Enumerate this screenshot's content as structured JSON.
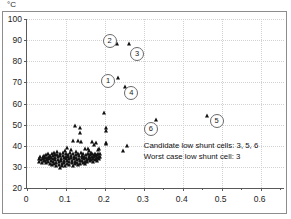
{
  "chart_data": {
    "type": "scatter",
    "title": "",
    "xlabel": "",
    "ylabel": "",
    "unit_label": "°C",
    "xlim": [
      0,
      0.66
    ],
    "ylim": [
      20,
      100
    ],
    "grid": true,
    "legend_position": "none",
    "xticks": [
      0,
      0.1,
      0.2,
      0.3,
      0.4,
      0.5,
      0.6
    ],
    "xtick_labels": [
      "0",
      "0.1",
      "0.2",
      "0.3",
      "0.4",
      "0.5",
      "0.6"
    ],
    "xminor_ticks": [
      0.05,
      0.15,
      0.25,
      0.35,
      0.45,
      0.55,
      0.65
    ],
    "yticks": [
      20,
      30,
      40,
      50,
      60,
      70,
      80,
      90,
      100
    ],
    "ytick_labels": [
      "20",
      "30",
      "40",
      "50",
      "60",
      "70",
      "80",
      "90",
      "100"
    ],
    "marker": "triangle",
    "marker_color": "#111111",
    "points": [
      [
        0.232,
        88.0
      ],
      [
        0.262,
        88.0
      ],
      [
        0.234,
        72.0
      ],
      [
        0.252,
        68.0
      ],
      [
        0.199,
        55.3
      ],
      [
        0.331,
        52.2
      ],
      [
        0.463,
        54.3
      ],
      [
        0.203,
        48.5
      ],
      [
        0.203,
        47.0
      ],
      [
        0.124,
        49.2
      ],
      [
        0.137,
        48.3
      ],
      [
        0.137,
        46.2
      ],
      [
        0.202,
        41.2
      ],
      [
        0.202,
        40.6
      ],
      [
        0.257,
        39.8
      ],
      [
        0.247,
        37.6
      ],
      [
        0.118,
        42.2
      ],
      [
        0.132,
        42.3
      ],
      [
        0.139,
        41.8
      ],
      [
        0.167,
        41.7
      ],
      [
        0.176,
        41.5
      ],
      [
        0.172,
        40.2
      ],
      [
        0.182,
        38.2
      ],
      [
        0.186,
        38.3
      ],
      [
        0.113,
        38.0
      ],
      [
        0.127,
        37.2
      ],
      [
        0.104,
        38.7
      ],
      [
        0.098,
        37.4
      ],
      [
        0.148,
        38.4
      ],
      [
        0.156,
        38.5
      ],
      [
        0.16,
        37.6
      ],
      [
        0.165,
        36.8
      ],
      [
        0.03,
        33.6
      ],
      [
        0.032,
        32.4
      ],
      [
        0.034,
        34.5
      ],
      [
        0.036,
        33.1
      ],
      [
        0.038,
        32.0
      ],
      [
        0.04,
        34.8
      ],
      [
        0.041,
        33.8
      ],
      [
        0.043,
        32.6
      ],
      [
        0.044,
        35.2
      ],
      [
        0.046,
        34.0
      ],
      [
        0.047,
        33.0
      ],
      [
        0.048,
        31.8
      ],
      [
        0.05,
        35.6
      ],
      [
        0.051,
        34.4
      ],
      [
        0.052,
        33.3
      ],
      [
        0.054,
        32.2
      ],
      [
        0.055,
        36.0
      ],
      [
        0.056,
        34.7
      ],
      [
        0.057,
        33.6
      ],
      [
        0.058,
        31.4
      ],
      [
        0.06,
        35.1
      ],
      [
        0.061,
        34.1
      ],
      [
        0.062,
        32.9
      ],
      [
        0.063,
        30.9
      ],
      [
        0.064,
        36.3
      ],
      [
        0.066,
        35.0
      ],
      [
        0.067,
        33.9
      ],
      [
        0.068,
        32.5
      ],
      [
        0.069,
        31.2
      ],
      [
        0.07,
        36.6
      ],
      [
        0.071,
        35.4
      ],
      [
        0.072,
        34.2
      ],
      [
        0.073,
        33.1
      ],
      [
        0.074,
        31.9
      ],
      [
        0.075,
        30.6
      ],
      [
        0.077,
        36.9
      ],
      [
        0.078,
        35.7
      ],
      [
        0.079,
        34.6
      ],
      [
        0.08,
        33.4
      ],
      [
        0.081,
        32.3
      ],
      [
        0.082,
        31.0
      ],
      [
        0.084,
        29.6
      ],
      [
        0.085,
        36.2
      ],
      [
        0.086,
        35.0
      ],
      [
        0.087,
        33.8
      ],
      [
        0.088,
        32.7
      ],
      [
        0.089,
        31.5
      ],
      [
        0.09,
        30.3
      ],
      [
        0.092,
        36.5
      ],
      [
        0.093,
        35.3
      ],
      [
        0.094,
        34.1
      ],
      [
        0.095,
        33.0
      ],
      [
        0.096,
        31.8
      ],
      [
        0.097,
        30.5
      ],
      [
        0.099,
        36.1
      ],
      [
        0.1,
        34.9
      ],
      [
        0.101,
        33.7
      ],
      [
        0.102,
        32.6
      ],
      [
        0.103,
        31.4
      ],
      [
        0.105,
        35.8
      ],
      [
        0.106,
        34.6
      ],
      [
        0.107,
        33.5
      ],
      [
        0.108,
        32.3
      ],
      [
        0.109,
        31.1
      ],
      [
        0.11,
        36.4
      ],
      [
        0.112,
        35.2
      ],
      [
        0.114,
        34.0
      ],
      [
        0.115,
        32.8
      ],
      [
        0.116,
        31.6
      ],
      [
        0.117,
        30.4
      ],
      [
        0.119,
        36.0
      ],
      [
        0.12,
        34.8
      ],
      [
        0.121,
        33.6
      ],
      [
        0.122,
        32.4
      ],
      [
        0.123,
        31.2
      ],
      [
        0.125,
        35.5
      ],
      [
        0.126,
        34.3
      ],
      [
        0.128,
        33.2
      ],
      [
        0.129,
        32.0
      ],
      [
        0.13,
        30.8
      ],
      [
        0.131,
        36.2
      ],
      [
        0.133,
        35.0
      ],
      [
        0.134,
        33.8
      ],
      [
        0.135,
        32.7
      ],
      [
        0.136,
        31.5
      ],
      [
        0.138,
        36.5
      ],
      [
        0.14,
        35.3
      ],
      [
        0.141,
        34.2
      ],
      [
        0.142,
        33.0
      ],
      [
        0.143,
        31.8
      ],
      [
        0.145,
        36.0
      ],
      [
        0.146,
        34.8
      ],
      [
        0.147,
        33.7
      ],
      [
        0.149,
        32.5
      ],
      [
        0.15,
        31.3
      ],
      [
        0.151,
        35.6
      ],
      [
        0.152,
        34.4
      ],
      [
        0.154,
        33.2
      ],
      [
        0.155,
        32.1
      ],
      [
        0.157,
        36.1
      ],
      [
        0.158,
        34.9
      ],
      [
        0.159,
        33.8
      ],
      [
        0.161,
        32.6
      ],
      [
        0.162,
        35.4
      ],
      [
        0.163,
        34.2
      ],
      [
        0.164,
        33.1
      ],
      [
        0.166,
        36.0
      ],
      [
        0.168,
        34.8
      ],
      [
        0.169,
        33.6
      ],
      [
        0.17,
        32.4
      ],
      [
        0.171,
        35.8
      ],
      [
        0.173,
        34.5
      ],
      [
        0.174,
        33.4
      ],
      [
        0.175,
        36.2
      ],
      [
        0.177,
        35.0
      ],
      [
        0.178,
        33.9
      ],
      [
        0.179,
        32.7
      ],
      [
        0.18,
        35.5
      ],
      [
        0.181,
        34.3
      ],
      [
        0.183,
        36.0
      ],
      [
        0.184,
        34.9
      ],
      [
        0.185,
        33.7
      ],
      [
        0.187,
        35.9
      ],
      [
        0.188,
        34.6
      ]
    ],
    "callouts": [
      {
        "label": "1",
        "x": 0.208,
        "y": 70.5
      },
      {
        "label": "2",
        "x": 0.212,
        "y": 89.5
      },
      {
        "label": "3",
        "x": 0.283,
        "y": 83.5
      },
      {
        "label": "4",
        "x": 0.268,
        "y": 65.0
      },
      {
        "label": "5",
        "x": 0.487,
        "y": 51.5
      },
      {
        "label": "6",
        "x": 0.318,
        "y": 48.0
      }
    ],
    "annotations": [
      "Candidate low shunt cells: 3, 5, 6",
      "Worst case low shunt cell: 3"
    ]
  }
}
